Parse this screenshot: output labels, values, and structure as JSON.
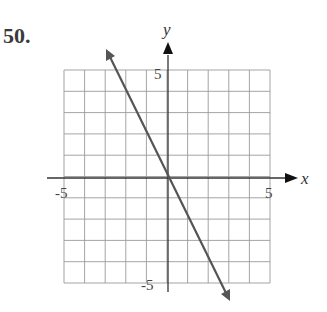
{
  "problem_number": "50.",
  "chart_data": {
    "type": "line",
    "title": "",
    "xlabel": "x",
    "ylabel": "y",
    "xlim": [
      -5,
      5
    ],
    "ylim": [
      -5,
      5
    ],
    "grid": true,
    "tick_labels": {
      "x": [
        "-5",
        "5"
      ],
      "y": [
        "5",
        "-5"
      ]
    },
    "series": [
      {
        "name": "line",
        "equation": "y = -2x",
        "slope": -2,
        "intercept": 0,
        "x": [
          -3,
          0,
          3
        ],
        "y": [
          6,
          0,
          -6
        ],
        "arrows": "both"
      }
    ]
  }
}
